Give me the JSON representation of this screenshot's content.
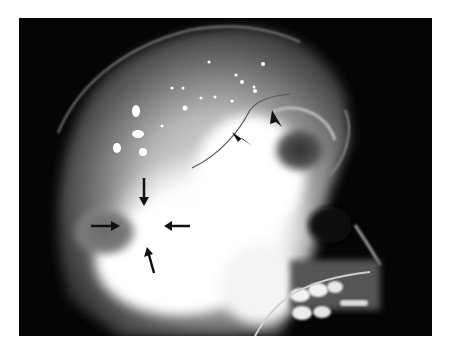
{
  "figure": {
    "type": "radiograph",
    "view": "lateral skull radiograph",
    "background_color": "#050505",
    "page_background": "#ffffff",
    "annotations": {
      "arrows": [
        {
          "id": "arrow-down",
          "direction": "down",
          "from": [
            144,
            178
          ],
          "to": [
            144,
            205
          ]
        },
        {
          "id": "arrow-right",
          "direction": "right",
          "from": [
            91,
            226
          ],
          "to": [
            119,
            226
          ]
        },
        {
          "id": "arrow-left",
          "direction": "left",
          "from": [
            190,
            226
          ],
          "to": [
            164,
            226
          ]
        },
        {
          "id": "arrow-up",
          "direction": "up",
          "from": [
            154,
            273
          ],
          "to": [
            148,
            248
          ]
        }
      ],
      "arrowheads": [
        {
          "id": "arrowhead-lower",
          "tip": [
            252,
            146
          ],
          "pointing": "down-right"
        },
        {
          "id": "arrowhead-upper",
          "tip": [
            282,
            127
          ],
          "pointing": "down"
        }
      ],
      "color": "#111111"
    }
  }
}
